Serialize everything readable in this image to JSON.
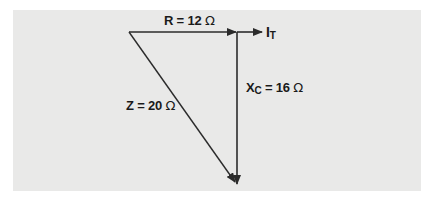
{
  "diagram": {
    "type": "impedance-phasor-triangle",
    "labels": {
      "resistance": {
        "name": "R",
        "eq": " = ",
        "value": "12",
        "unit": "Ω"
      },
      "reactance": {
        "name": "X",
        "subscript": "C",
        "eq": " = ",
        "value": "16",
        "unit": "Ω"
      },
      "impedance": {
        "name": "Z",
        "eq": " = ",
        "value": "20",
        "unit": "Ω"
      },
      "current": {
        "name": "I",
        "subscript": "T"
      }
    },
    "colors": {
      "background": "#e9e9e8",
      "line": "#2b2b2b",
      "text": "#1a1a1a"
    }
  }
}
